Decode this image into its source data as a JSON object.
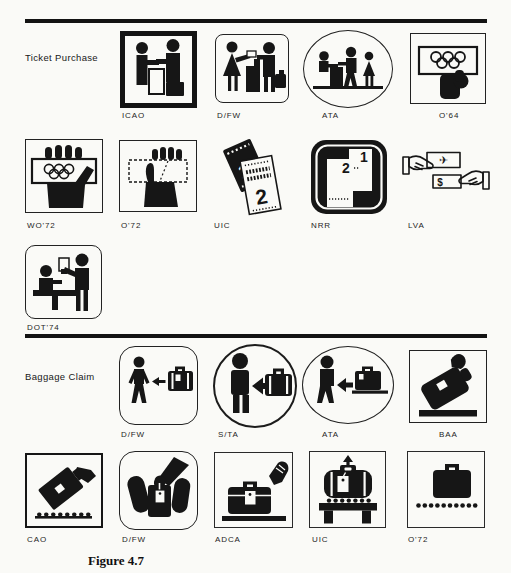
{
  "page": {
    "paper_color": "#fafaf7",
    "ink_color": "#161616",
    "caption": "Figure 4.7"
  },
  "sections": [
    {
      "title": "Ticket Purchase",
      "rows": [
        {
          "items": [
            {
              "label": "ICAO",
              "icon": "ticket-counter-exchange-icon"
            },
            {
              "label": "D/FW",
              "icon": "woman-buying-ticket-icon"
            },
            {
              "label": "ATA",
              "icon": "ticket-desk-scene-icon"
            },
            {
              "label": "O'64",
              "icon": "hand-olympic-rings-card-icon"
            }
          ]
        },
        {
          "items": [
            {
              "label": "WO'72",
              "icon": "hand-olympic-ticket-icon"
            },
            {
              "label": "O'72",
              "icon": "hand-ticket-icon"
            },
            {
              "label": "UIC",
              "icon": "two-tickets-icon"
            },
            {
              "label": "NRR",
              "icon": "numbered-tickets-icon"
            },
            {
              "label": "LVA",
              "icon": "ticket-money-exchange-icon"
            }
          ]
        },
        {
          "items": [
            {
              "label": "DOT'74",
              "icon": "ticket-agent-counter-icon"
            }
          ]
        }
      ]
    },
    {
      "title": "Baggage Claim",
      "rows": [
        {
          "items": [
            {
              "label": "D/FW",
              "icon": "person-arrow-suitcase-icon"
            },
            {
              "label": "S/TA",
              "icon": "person-arrow-suitcase-circle-icon"
            },
            {
              "label": "ATA",
              "icon": "person-arrow-suitcase-belt-icon"
            },
            {
              "label": "BAA",
              "icon": "tilted-suitcase-hand-icon"
            }
          ]
        },
        {
          "items": [
            {
              "label": "CAO",
              "icon": "tilted-suitcase-conveyor-icon"
            },
            {
              "label": "D/FW",
              "icon": "hand-grabbing-suitcase-icon"
            },
            {
              "label": "ADCA",
              "icon": "suitcase-tag-hand-belt-icon"
            },
            {
              "label": "UIC",
              "icon": "suitcase-tag-bench-icon"
            },
            {
              "label": "O'72",
              "icon": "suitcase-dots-icon"
            }
          ]
        }
      ]
    }
  ],
  "glyphs": {
    "nrr_ticket_1": "1",
    "nrr_ticket_2": "2",
    "uic_ticket_1": "1",
    "uic_ticket_2": "2",
    "lva_plane": "✈",
    "lva_dollar": "$"
  }
}
